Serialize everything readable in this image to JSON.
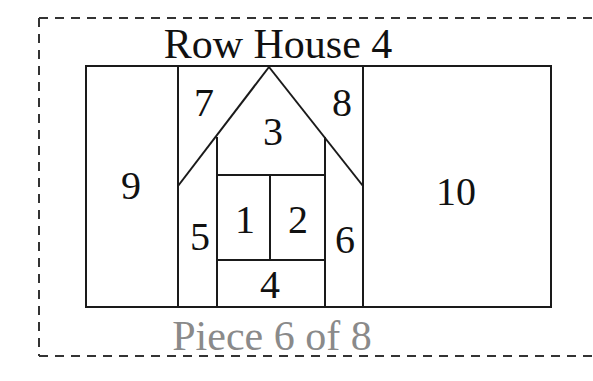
{
  "title": "Row House 4",
  "footer": "Piece 6 of 8",
  "colors": {
    "line": "#1a1a1a",
    "text": "#111111",
    "footer_text": "#8a8a8a",
    "dashed_border": "#333333",
    "background": "#ffffff"
  },
  "pieces": [
    {
      "id": "1",
      "label": "1"
    },
    {
      "id": "2",
      "label": "2"
    },
    {
      "id": "3",
      "label": "3"
    },
    {
      "id": "4",
      "label": "4"
    },
    {
      "id": "5",
      "label": "5"
    },
    {
      "id": "6",
      "label": "6"
    },
    {
      "id": "7",
      "label": "7"
    },
    {
      "id": "8",
      "label": "8"
    },
    {
      "id": "9",
      "label": "9"
    },
    {
      "id": "10",
      "label": "10"
    }
  ]
}
